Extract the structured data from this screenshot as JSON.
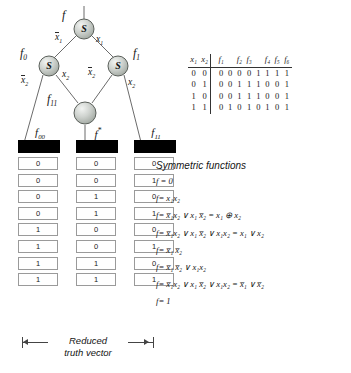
{
  "graph": {
    "root_label": "f",
    "nodes": [
      {
        "id": "n_root",
        "label": "S",
        "type": "symmetric-node"
      },
      {
        "id": "n_left",
        "label": "S",
        "type": "symmetric-node"
      },
      {
        "id": "n_right",
        "label": "S",
        "type": "symmetric-node"
      },
      {
        "id": "n_shared",
        "label": "",
        "type": "terminal-node"
      }
    ],
    "node_function_labels": {
      "root": "f",
      "left": "f₀",
      "right": "f₁",
      "shared": "f₁₁"
    },
    "edge_labels": {
      "root_left": "x̅₁",
      "root_right": "x₁",
      "left_down_left": "x̅₂",
      "left_down_right": "x₂",
      "right_down_left": "x̅₂",
      "right_down_right": "x₂"
    }
  },
  "vectors": {
    "columns": [
      {
        "name": "f00",
        "label": "f₀₀",
        "bits": [
          "0",
          "0",
          "0",
          "0",
          "1",
          "1",
          "1",
          "1"
        ]
      },
      {
        "name": "fstar",
        "label": "f*",
        "bits": [
          "0",
          "0",
          "1",
          "1",
          "0",
          "0",
          "1",
          "1"
        ]
      },
      {
        "name": "f11",
        "label": "f₁₁",
        "bits": [
          "0",
          "1",
          "0",
          "1",
          "0",
          "1",
          "0",
          "1"
        ]
      }
    ],
    "bracket_caption_line1": "Reduced",
    "bracket_caption_line2": "truth  vector"
  },
  "truth_table": {
    "input_headers": [
      "x₁",
      "x₂"
    ],
    "function_headers": [
      "f₁",
      "f₂",
      "f₃",
      "f₄",
      "f₅",
      "f₆"
    ],
    "rows": [
      {
        "inputs": [
          "0",
          "0"
        ],
        "values": [
          "0",
          "0",
          "0",
          "0",
          "1",
          "1",
          "1",
          "1"
        ]
      },
      {
        "inputs": [
          "0",
          "1"
        ],
        "values": [
          "0",
          "0",
          "1",
          "1",
          "1",
          "0",
          "0",
          "1"
        ]
      },
      {
        "inputs": [
          "1",
          "0"
        ],
        "values": [
          "0",
          "0",
          "1",
          "1",
          "1",
          "0",
          "0",
          "1"
        ]
      },
      {
        "inputs": [
          "1",
          "1"
        ],
        "values": [
          "0",
          "1",
          "0",
          "1",
          "0",
          "1",
          "0",
          "1"
        ]
      }
    ]
  },
  "symmetric_functions": {
    "title": "Symmetric functions",
    "items": [
      {
        "lhs": "f =",
        "rhs": "0"
      },
      {
        "lhs": "f=",
        "rhs": "x₁x₂"
      },
      {
        "lhs": "f=",
        "rhs": "x̅₁x₂ ∨ x₁ x̅₂ = x₁ ⊕ x₂"
      },
      {
        "lhs": "f=",
        "rhs": "x̅₁x₂ ∨ x₁ x̅₂ ∨ x₁x₂ = x₁ ∨ x₂"
      },
      {
        "lhs": "f=",
        "rhs": "x̅₁ x̅₂"
      },
      {
        "lhs": "f=",
        "rhs": "x̅₁ x̅₂ ∨ x₁x₂"
      },
      {
        "lhs": "f=",
        "rhs": "x̅₁x₂ ∨ x₁ x̅₂ ∨ x₁x₂ = x̅₁ ∨ x̅₂"
      },
      {
        "lhs": "f=",
        "rhs": "1"
      }
    ]
  },
  "colors": {
    "node_fill": "#c9cdc9",
    "node_stroke": "#5a5f5a",
    "edge": "#6b6b6b",
    "cap_fill": "#000000",
    "cell_border": "#9a9a9a",
    "text": "#1a1a1a"
  }
}
